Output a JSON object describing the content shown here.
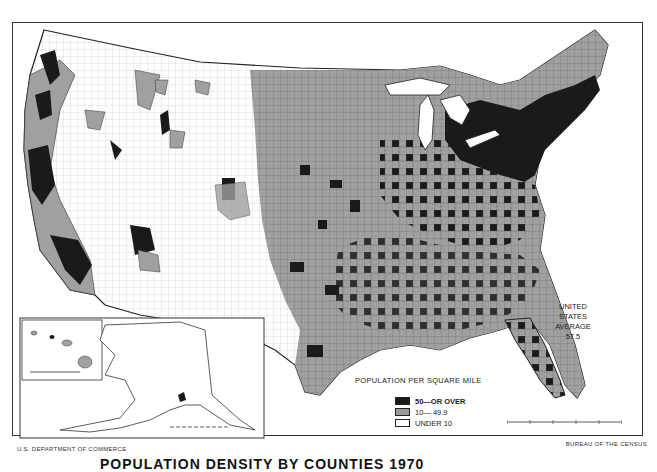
{
  "map": {
    "title": "POPULATION DENSITY BY COUNTIES 1970",
    "title_visible_fragment": "POPULATION DENSITY BY COUNTIES 1970",
    "credits": {
      "left": "U.S. DEPARTMENT OF COMMERCE",
      "right": "BUREAU OF THE CENSUS"
    },
    "average_annotation": {
      "line1": "UNITED STATES",
      "line2": "AVERAGE",
      "value": "57.5"
    },
    "legend": {
      "title": "POPULATION PER SQUARE MILE",
      "items": [
        {
          "label": "50—OR OVER",
          "color": "#1a1a1a"
        },
        {
          "label": "10— 49.9",
          "color": "#9a9a9a"
        },
        {
          "label": "UNDER 10",
          "color": "#ffffff"
        }
      ]
    },
    "insets": [
      "Alaska",
      "Hawaii"
    ],
    "colors": {
      "high": "#1a1a1a",
      "medium": "#9a9a9a",
      "low": "#ffffff",
      "border": "#333333"
    }
  }
}
